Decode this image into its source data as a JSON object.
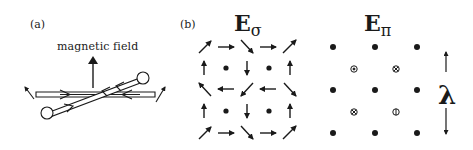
{
  "panel_a": {
    "label": "(a)",
    "field_label": "magnetic field"
  },
  "panel_b": {
    "label": "(b)",
    "e_sigma": {
      "symbol": "E",
      "subscript": "σ"
    },
    "e_pi": {
      "symbol": "E",
      "subscript": "π"
    },
    "wavelength_symbol": "λ"
  },
  "colors": {
    "ink": "#1a1a1a",
    "background": "#ffffff"
  }
}
